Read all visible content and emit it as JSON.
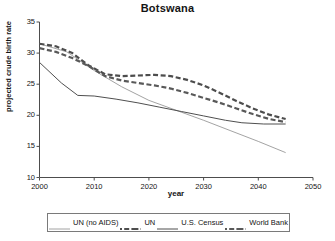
{
  "chart_data": {
    "type": "line",
    "title": "Botswana",
    "xlabel": "year",
    "ylabel": "projected crude birth rate",
    "xlim": [
      2000,
      2050
    ],
    "ylim": [
      10,
      35
    ],
    "xticks": [
      2000,
      2010,
      2020,
      2030,
      2040,
      2050
    ],
    "yticks": [
      10,
      15,
      20,
      25,
      30,
      35
    ],
    "grid": false,
    "legend_position": "bottom",
    "series": [
      {
        "name": "UN (no AIDS)",
        "style": "solid-thin",
        "color": "#8c8c8c",
        "width": 0.8,
        "x": [
          2000,
          2005,
          2010,
          2015,
          2020,
          2025,
          2030,
          2035,
          2040,
          2045
        ],
        "y": [
          31.5,
          30.2,
          27.2,
          24.6,
          22.4,
          20.8,
          19.2,
          17.5,
          15.8,
          14.0
        ]
      },
      {
        "name": "UN",
        "style": "dashed",
        "color": "#4d4d4d",
        "width": 2.2,
        "x": [
          2000,
          2003,
          2006,
          2009,
          2012,
          2015,
          2018,
          2021,
          2024,
          2027,
          2030,
          2033,
          2036,
          2039,
          2042,
          2045
        ],
        "y": [
          31.5,
          31.1,
          30.0,
          28.0,
          26.6,
          26.3,
          26.4,
          26.5,
          26.3,
          25.7,
          24.8,
          23.6,
          22.3,
          21.1,
          20.1,
          19.4
        ]
      },
      {
        "name": "U.S. Census",
        "style": "solid",
        "color": "#4f4f4f",
        "width": 1.0,
        "x": [
          2000,
          2004,
          2007,
          2010,
          2014,
          2018,
          2022,
          2026,
          2030,
          2034,
          2037,
          2041,
          2045
        ],
        "y": [
          28.5,
          25.2,
          23.2,
          23.1,
          22.6,
          22.0,
          21.3,
          20.6,
          19.9,
          19.2,
          18.8,
          18.6,
          18.6
        ]
      },
      {
        "name": "World Bank",
        "style": "dashed",
        "color": "#595959",
        "width": 2.2,
        "x": [
          2000,
          2003,
          2006,
          2009,
          2012,
          2015,
          2018,
          2021,
          2024,
          2027,
          2030,
          2033,
          2036,
          2039,
          2042,
          2045
        ],
        "y": [
          30.8,
          30.2,
          29.2,
          27.9,
          26.3,
          25.6,
          25.2,
          24.8,
          24.3,
          23.6,
          22.8,
          22.0,
          21.1,
          20.2,
          19.4,
          18.9
        ]
      }
    ]
  },
  "axis": {
    "yticks": [
      "35",
      "30",
      "25",
      "20",
      "15",
      "10"
    ],
    "xticks": [
      "2000",
      "2010",
      "2020",
      "2030",
      "2040",
      "2050"
    ]
  },
  "legend": {
    "items": [
      {
        "label": "UN (no AIDS)",
        "style": "solid-thin"
      },
      {
        "label": "UN",
        "style": "dashed"
      },
      {
        "label": "U.S. Census",
        "style": "solid"
      },
      {
        "label": "World Bank",
        "style": "dashed"
      }
    ]
  }
}
